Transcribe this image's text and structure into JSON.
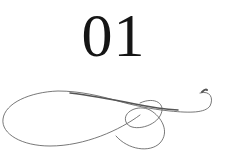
{
  "heading": {
    "number": "01"
  },
  "ornament": {
    "icon": "calligraphic-flourish-icon",
    "stroke_color": "#555555"
  }
}
